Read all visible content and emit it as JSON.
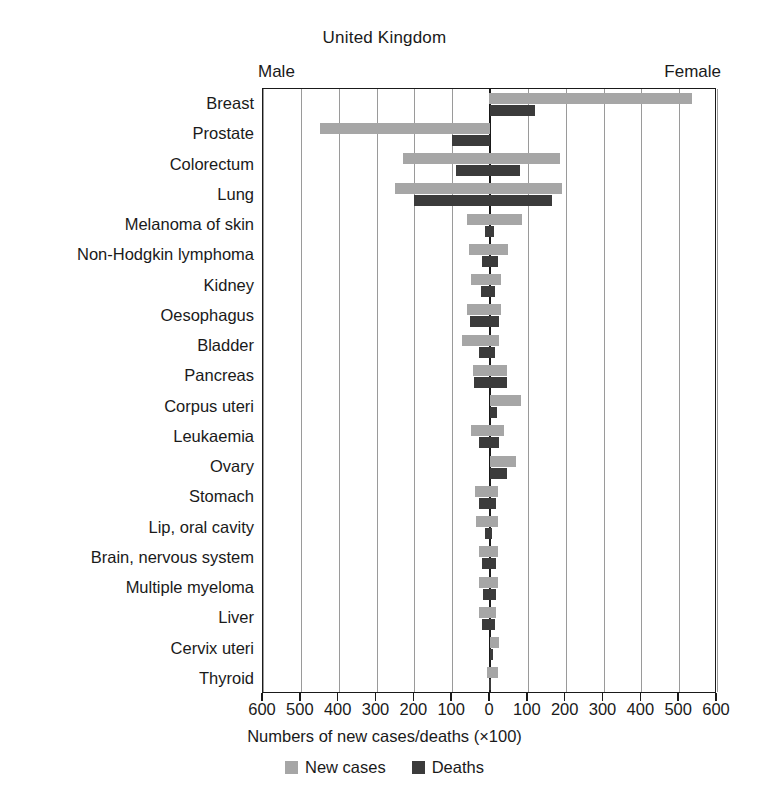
{
  "chart_data": {
    "type": "bar",
    "subtype": "diverging-population-pyramid",
    "title": "United Kingdom",
    "xlabel": "Numbers of new cases/deaths (×100)",
    "ylabel": "",
    "left_side_label": "Male",
    "right_side_label": "Female",
    "xlim": [
      -600,
      600
    ],
    "xticks": [
      600,
      500,
      400,
      300,
      200,
      100,
      0,
      100,
      200,
      300,
      400,
      500,
      600
    ],
    "xtick_values": [
      -600,
      -500,
      -400,
      -300,
      -200,
      -100,
      0,
      100,
      200,
      300,
      400,
      500,
      600
    ],
    "grid": true,
    "grid_axis": "x",
    "legend_position": "bottom",
    "legend": [
      "New cases",
      "Deaths"
    ],
    "units_note": "values are numbers of new cases/deaths divided by 100",
    "colors": {
      "new_cases": "#a6a6a6",
      "deaths": "#3b3b3b",
      "axis": "#1a1a1a",
      "grid": "#9a9a9a"
    },
    "categories": [
      "Breast",
      "Prostate",
      "Colorectum",
      "Lung",
      "Melanoma of skin",
      "Non-Hodgkin lymphoma",
      "Kidney",
      "Oesophagus",
      "Bladder",
      "Pancreas",
      "Corpus uteri",
      "Leukaemia",
      "Ovary",
      "Stomach",
      "Lip, oral cavity",
      "Brain, nervous system",
      "Multiple myeloma",
      "Liver",
      "Cervix uteri",
      "Thyroid"
    ],
    "series": [
      {
        "name": "Male new cases",
        "side": "left",
        "metric": "new_cases",
        "values": [
          3,
          450,
          230,
          250,
          60,
          55,
          50,
          60,
          75,
          45,
          0,
          50,
          0,
          40,
          38,
          30,
          28,
          28,
          0,
          8
        ]
      },
      {
        "name": "Male deaths",
        "side": "left",
        "metric": "deaths",
        "values": [
          1,
          100,
          90,
          200,
          12,
          22,
          25,
          52,
          28,
          42,
          0,
          30,
          0,
          28,
          12,
          22,
          18,
          22,
          0,
          2
        ]
      },
      {
        "name": "Female new cases",
        "side": "right",
        "metric": "new_cases",
        "values": [
          535,
          0,
          185,
          190,
          85,
          48,
          30,
          30,
          25,
          45,
          82,
          38,
          70,
          22,
          20,
          22,
          22,
          15,
          25,
          20
        ]
      },
      {
        "name": "Female deaths",
        "side": "right",
        "metric": "deaths",
        "values": [
          120,
          0,
          80,
          165,
          10,
          20,
          14,
          25,
          12,
          45,
          18,
          25,
          45,
          16,
          6,
          16,
          15,
          12,
          8,
          3
        ]
      }
    ]
  },
  "legend_labels": {
    "new_cases": "New cases",
    "deaths": "Deaths"
  }
}
